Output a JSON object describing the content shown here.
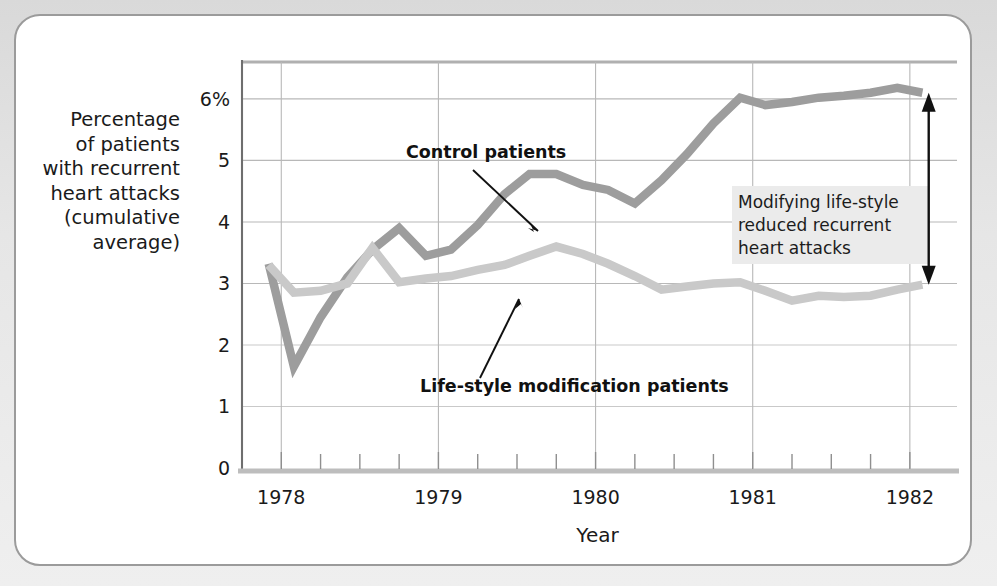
{
  "figure": {
    "frame_border_color": "#9b9b9b",
    "background_color": "#ffffff",
    "page_background_color": "#e6e6e6"
  },
  "axis": {
    "y_label_lines": [
      "Percentage",
      "of patients",
      "with recurrent",
      "heart attacks",
      "(cumulative",
      "average)"
    ],
    "y_ticks": [
      "6%",
      "5",
      "4",
      "3",
      "2",
      "1",
      "0"
    ],
    "y_tick_values": [
      6,
      5,
      4,
      3,
      2,
      1,
      0
    ],
    "x_title": "Year",
    "x_year_labels": [
      "1978",
      "1979",
      "1980",
      "1981",
      "1982"
    ]
  },
  "labels": {
    "control": "Control patients",
    "lifestyle": "Life-style modification patients"
  },
  "annotation": {
    "lines": [
      "Modifying life-style",
      "reduced recurrent",
      "heart attacks"
    ],
    "background_color": "#ebebeb",
    "arrow_top_value": 6.1,
    "arrow_bottom_value": 2.98
  },
  "colors": {
    "control_line": "#9d9d9d",
    "lifestyle_line": "#c9c9c9",
    "gridline": "#b8b8b8",
    "axis_line": "#6e6e6e",
    "text": "#1a1a1a"
  },
  "chart_data": {
    "type": "line",
    "title": "",
    "xlabel": "Year",
    "ylabel": "Percentage of patients with recurrent heart attacks (cumulative average)",
    "xlim": [
      1977.75,
      1982.3
    ],
    "ylim": [
      0,
      6.6
    ],
    "grid": true,
    "legend_position": "inline-annotations",
    "x": [
      1977.92,
      1978.08,
      1978.25,
      1978.42,
      1978.58,
      1978.75,
      1978.92,
      1979.08,
      1979.25,
      1979.42,
      1979.58,
      1979.75,
      1979.92,
      1980.08,
      1980.25,
      1980.42,
      1980.58,
      1980.75,
      1980.92,
      1981.08,
      1981.25,
      1981.42,
      1981.58,
      1981.75,
      1981.92,
      1982.08
    ],
    "series": [
      {
        "name": "Control patients",
        "color": "#9d9d9d",
        "values": [
          3.32,
          1.65,
          2.45,
          3.1,
          3.55,
          3.9,
          3.45,
          3.55,
          3.95,
          4.45,
          4.78,
          4.78,
          4.6,
          4.52,
          4.3,
          4.68,
          5.1,
          5.6,
          6.02,
          5.9,
          5.95,
          6.02,
          6.05,
          6.1,
          6.18,
          6.1
        ]
      },
      {
        "name": "Life-style modification patients",
        "color": "#c9c9c9",
        "values": [
          3.3,
          2.85,
          2.88,
          3.0,
          3.58,
          3.02,
          3.08,
          3.12,
          3.22,
          3.3,
          3.45,
          3.6,
          3.48,
          3.32,
          3.12,
          2.9,
          2.95,
          3.0,
          3.02,
          2.88,
          2.72,
          2.8,
          2.78,
          2.8,
          2.9,
          2.98
        ]
      }
    ],
    "annotations": [
      {
        "text": "Control patients",
        "points_to_value": 4.2
      },
      {
        "text": "Life-style modification patients",
        "points_to_value": 3.2
      },
      {
        "text": "Modifying life-style reduced recurrent heart attacks",
        "span": [
          2.98,
          6.1
        ]
      }
    ]
  }
}
